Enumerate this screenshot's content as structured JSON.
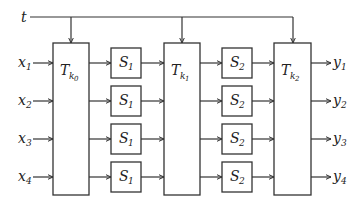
{
  "diagram": {
    "type": "block-diagram",
    "tweak_input": {
      "label": "t"
    },
    "inputs": [
      {
        "base": "x",
        "sub": "1"
      },
      {
        "base": "x",
        "sub": "2"
      },
      {
        "base": "x",
        "sub": "3"
      },
      {
        "base": "x",
        "sub": "4"
      }
    ],
    "outputs": [
      {
        "base": "y",
        "sub": "1"
      },
      {
        "base": "y",
        "sub": "2"
      },
      {
        "base": "y",
        "sub": "3"
      },
      {
        "base": "y",
        "sub": "4"
      }
    ],
    "tweakable_blocks": [
      {
        "base": "T",
        "sub": "k",
        "subsub": "0"
      },
      {
        "base": "T",
        "sub": "k",
        "subsub": "1"
      },
      {
        "base": "T",
        "sub": "k",
        "subsub": "2"
      }
    ],
    "sbox_layer_1": [
      {
        "base": "S",
        "sub": "1"
      },
      {
        "base": "S",
        "sub": "1"
      },
      {
        "base": "S",
        "sub": "1"
      },
      {
        "base": "S",
        "sub": "1"
      }
    ],
    "sbox_layer_2": [
      {
        "base": "S",
        "sub": "2"
      },
      {
        "base": "S",
        "sub": "2"
      },
      {
        "base": "S",
        "sub": "2"
      },
      {
        "base": "S",
        "sub": "2"
      }
    ],
    "colors": {
      "stroke": "#333333",
      "background": "#ffffff"
    }
  }
}
